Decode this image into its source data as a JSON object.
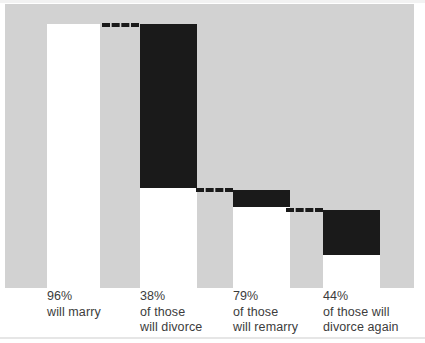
{
  "chart_data": {
    "type": "bar",
    "title": "",
    "subtitle": "",
    "xlabel": "",
    "ylabel": "",
    "grid": false,
    "legend": null,
    "orientation": "vertical",
    "style": "waterfall-funnel",
    "axis_baseline_note": "all bars share a common baseline; black segments show the portion that drops at each stage",
    "categories": [
      "96% will marry",
      "38% of those will divorce",
      "79% of those will remarry",
      "44% of those will divorce again"
    ],
    "values": [
      96,
      38,
      79,
      44
    ],
    "value_labels": [
      "96%",
      "38%",
      "79%",
      "44%"
    ],
    "series": [
      {
        "name": "stage",
        "values": [
          96,
          38,
          79,
          44
        ]
      }
    ],
    "annotations": [
      "dashed leader connects top of bar 1 to top of bar 2",
      "dashed leader connects bottom of bar 2 drop to top of bar 3 drop",
      "dashed leader connects bottom of bar 3 drop to top of bar 4 drop"
    ],
    "colors": {
      "field": "#d2d2d2",
      "bar_fill_light": "#ffffff",
      "bar_fill_dark": "#1a1a1a",
      "text": "#3c3c3c"
    }
  },
  "bars": [
    {
      "id": "bar-marry",
      "percent": "96%",
      "line1": "will marry",
      "line2": "",
      "tone": "light",
      "x": 47,
      "width": 53,
      "top": 24,
      "fill_top": 24,
      "fill_height": 264,
      "dark_top": 0,
      "dark_height": 0
    },
    {
      "id": "bar-divorce",
      "percent": "38%",
      "line1": "of those",
      "line2": "will divorce",
      "tone": "dark",
      "x": 140,
      "width": 57,
      "top": 24,
      "fill_top": 188,
      "fill_height": 100,
      "dark_top": 24,
      "dark_height": 164
    },
    {
      "id": "bar-remarry",
      "percent": "79%",
      "line1": "of those",
      "line2": "will remarry",
      "tone": "dark",
      "x": 233,
      "width": 57,
      "top": 190,
      "fill_top": 207,
      "fill_height": 81,
      "dark_top": 190,
      "dark_height": 17
    },
    {
      "id": "bar-divorce-again",
      "percent": "44%",
      "line1": "of those will",
      "line2": "divorce again",
      "tone": "dark",
      "x": 323,
      "width": 57,
      "top": 210,
      "fill_top": 255,
      "fill_height": 33,
      "dark_top": 210,
      "dark_height": 45
    }
  ],
  "leaders": [
    {
      "id": "leader-1",
      "x": 102,
      "y": 23,
      "width": 37
    },
    {
      "id": "leader-2",
      "x": 196,
      "y": 188,
      "width": 37
    },
    {
      "id": "leader-3",
      "x": 286,
      "y": 208,
      "width": 37
    }
  ],
  "labels": [
    {
      "id": "label-marry",
      "x": 47,
      "percent": "96%",
      "line1": "will marry",
      "line2": ""
    },
    {
      "id": "label-divorce",
      "x": 140,
      "percent": "38%",
      "line1": "of those",
      "line2": "will divorce"
    },
    {
      "id": "label-remarry",
      "x": 233,
      "percent": "79%",
      "line1": "of those",
      "line2": "will remarry"
    },
    {
      "id": "label-divorce-again",
      "x": 323,
      "percent": "44%",
      "line1": "of those will",
      "line2": "divorce again"
    }
  ]
}
